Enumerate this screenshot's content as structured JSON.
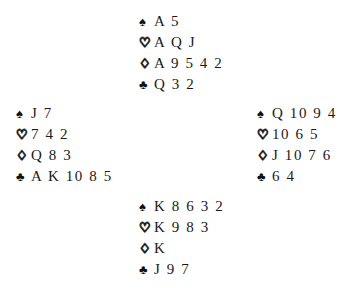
{
  "diagram": {
    "type": "bridge-deal-diagram",
    "background_color": "#ffffff",
    "text_color": "#1a1a1a"
  },
  "suit_symbols": {
    "spade": "♠",
    "heart": "♡",
    "diamond": "♢",
    "club": "♣"
  },
  "hands": {
    "north": {
      "position_label": "North",
      "spades": "A 5",
      "hearts": "A Q J",
      "diamonds": "A 9 5 4 2",
      "clubs": "Q 3 2"
    },
    "west": {
      "position_label": "West",
      "spades": "J 7",
      "hearts": "7 4 2",
      "diamonds": "Q 8 3",
      "clubs": "A K 10 8 5"
    },
    "east": {
      "position_label": "East",
      "spades": "Q 10 9 4",
      "hearts": "10 6 5",
      "diamonds": "J 10 7 6",
      "clubs": "6 4"
    },
    "south": {
      "position_label": "South",
      "spades": "K 8 6 3 2",
      "hearts": "K 9 8 3",
      "diamonds": "K",
      "clubs": "J 9 7"
    }
  }
}
